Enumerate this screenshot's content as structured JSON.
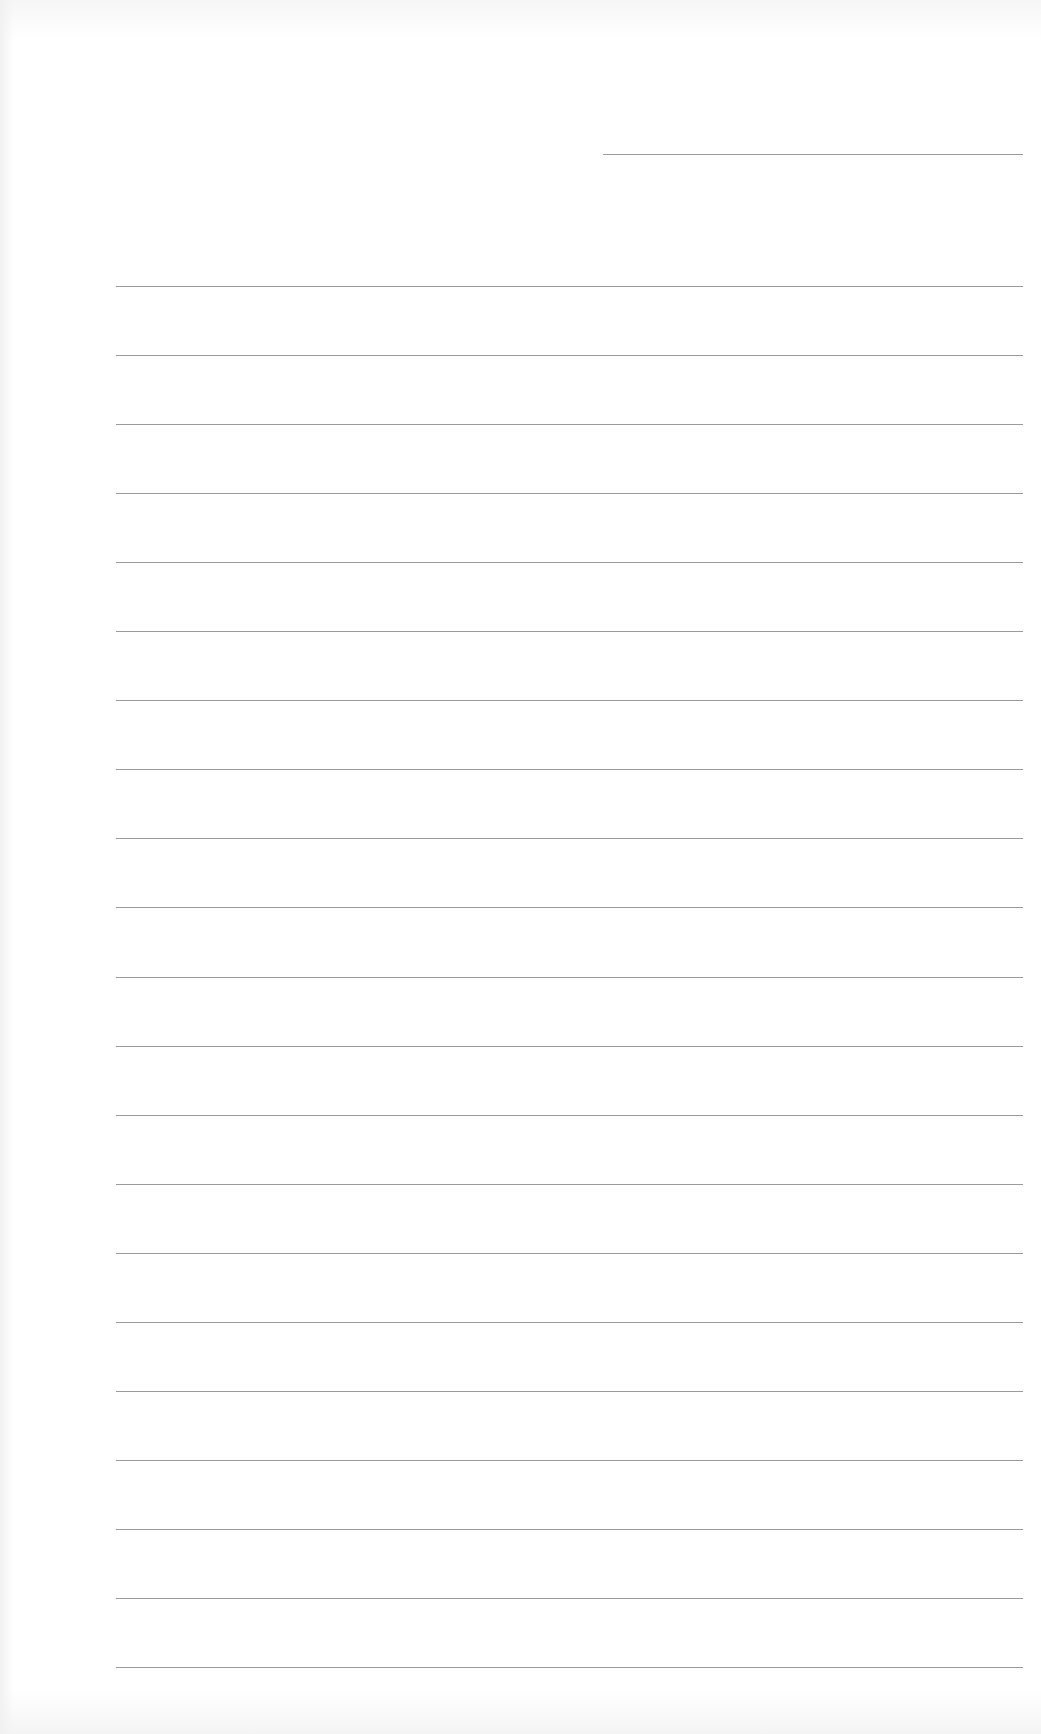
{
  "document": {
    "type": "lined-paper",
    "title_field": "",
    "line_count": 21,
    "line_color": "#8a8a8a",
    "background_color": "#ffffff",
    "lines": [
      "",
      "",
      "",
      "",
      "",
      "",
      "",
      "",
      "",
      "",
      "",
      "",
      "",
      "",
      "",
      "",
      "",
      "",
      "",
      "",
      ""
    ]
  }
}
